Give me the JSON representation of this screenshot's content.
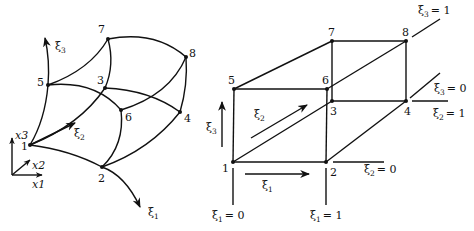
{
  "figure": {
    "left_panel": {
      "description": "Curved hexahedral element in physical space",
      "nodes": [
        {
          "id": "1",
          "x": 30,
          "y": 145
        },
        {
          "id": "2",
          "x": 102,
          "y": 167
        },
        {
          "id": "3",
          "x": 105,
          "y": 88
        },
        {
          "id": "4",
          "x": 180,
          "y": 112
        },
        {
          "id": "5",
          "x": 48,
          "y": 85
        },
        {
          "id": "6",
          "x": 121,
          "y": 110
        },
        {
          "id": "7",
          "x": 108,
          "y": 39
        },
        {
          "id": "8",
          "x": 186,
          "y": 57
        }
      ],
      "axes_labels": {
        "x1": "x1",
        "x2": "x2",
        "x3": "x3"
      },
      "xi_labels": {
        "xi1": "ξ",
        "xi2": "ξ",
        "xi3": "ξ",
        "sub1": "1",
        "sub2": "2",
        "sub3": "3"
      }
    },
    "right_panel": {
      "description": "Unit cube reference element in parametric space",
      "nodes": [
        {
          "id": "1",
          "x": 233,
          "y": 162
        },
        {
          "id": "2",
          "x": 326,
          "y": 162
        },
        {
          "id": "3",
          "x": 332,
          "y": 101
        },
        {
          "id": "4",
          "x": 406,
          "y": 101
        },
        {
          "id": "5",
          "x": 234,
          "y": 89
        },
        {
          "id": "6",
          "x": 327,
          "y": 89
        },
        {
          "id": "7",
          "x": 332,
          "y": 41
        },
        {
          "id": "8",
          "x": 406,
          "y": 41
        }
      ],
      "xi_labels": {
        "xi1": "ξ",
        "xi2": "ξ",
        "xi3": "ξ",
        "sub1": "1",
        "sub2": "2",
        "sub3": "3"
      },
      "plane_labels": {
        "xi1_eq_0": "= 0",
        "xi1_eq_1": "= 1",
        "xi2_eq_0": "= 0",
        "xi2_eq_1": "= 1",
        "xi3_eq_0": "= 0",
        "xi3_eq_1": "= 1"
      }
    }
  }
}
